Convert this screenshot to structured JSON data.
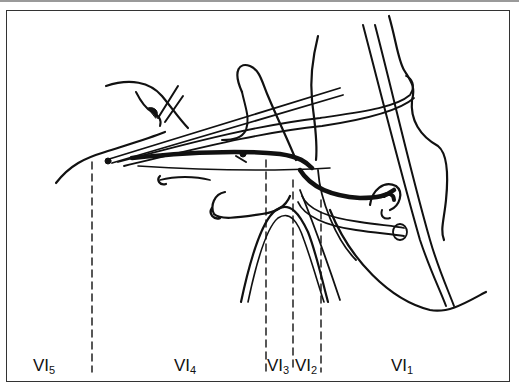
{
  "figure": {
    "type": "anatomical-line-drawing",
    "colors": {
      "ink": "#111111",
      "frame": "#333333",
      "background": "#ffffff"
    }
  },
  "labels": [
    {
      "id": "vi5",
      "base": "VI",
      "sub": "5",
      "x": 33
    },
    {
      "id": "vi4",
      "base": "VI",
      "sub": "4",
      "x": 174
    },
    {
      "id": "vi3",
      "base": "VI",
      "sub": "3",
      "x": 266
    },
    {
      "id": "vi2",
      "base": "VI",
      "sub": "2",
      "x": 295
    },
    {
      "id": "vi1",
      "base": "VI",
      "sub": "1",
      "x": 391
    }
  ],
  "dashed_boundaries_x": [
    92,
    266,
    293,
    321
  ]
}
